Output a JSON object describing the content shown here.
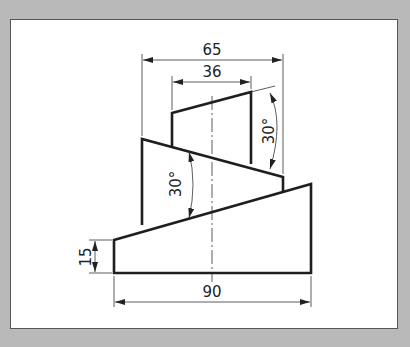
{
  "drawing": {
    "title": "Stepped wedge block drawing",
    "dimensions": {
      "overall_top_width": "65",
      "top_block_width": "36",
      "top_angle": "30°",
      "middle_angle": "30°",
      "base_left_height": "15",
      "base_width": "90"
    }
  },
  "colors": {
    "frame_background": "#b9b9b9",
    "panel_background": "#ffffff",
    "line_color": "#1e1e1e"
  }
}
